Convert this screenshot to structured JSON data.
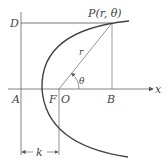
{
  "diagram": {
    "type": "parabola-polar-construction",
    "labels": {
      "point": "P(r, θ)",
      "directrix_point": "D",
      "A": "A",
      "F": "F",
      "O": "O",
      "B": "B",
      "x_axis": "x",
      "radius": "r",
      "angle": "θ",
      "distance": "k"
    },
    "colors": {
      "stroke": "#555555",
      "curve": "#444444",
      "text": "#444444"
    }
  }
}
